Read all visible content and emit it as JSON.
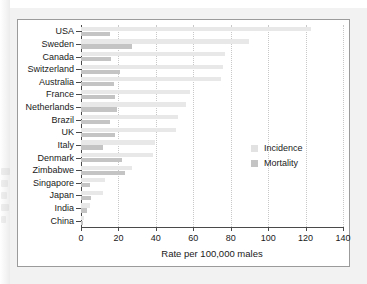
{
  "chart_data": {
    "type": "bar",
    "orientation": "horizontal",
    "title": "",
    "xlabel": "Rate per 100,000 males",
    "ylabel": "",
    "xlim": [
      0,
      140
    ],
    "xticks": [
      0,
      20,
      40,
      60,
      80,
      100,
      120,
      140
    ],
    "xtick_labels": [
      "0",
      "20",
      "40",
      "60",
      "80",
      "100",
      "120",
      "140"
    ],
    "grid": "vertical-dotted",
    "legend_position": "inside-right",
    "categories": [
      "USA",
      "Sweden",
      "Canada",
      "Switzerland",
      "Australia",
      "France",
      "Netherlands",
      "Brazil",
      "UK",
      "Italy",
      "Denmark",
      "Zimbabwe",
      "Singapore",
      "Japan",
      "India",
      "China"
    ],
    "series": [
      {
        "name": "Incidence",
        "color": "#e8e8e8",
        "values": [
          123,
          90,
          77,
          76,
          75,
          58,
          56,
          52,
          51,
          39.5,
          38.5,
          27,
          13,
          12,
          5,
          1.5
        ]
      },
      {
        "name": "Mortality",
        "color": "#c4c4c4",
        "values": [
          15.5,
          27,
          16,
          21,
          17.5,
          18,
          19,
          15.5,
          18,
          12,
          22,
          23.5,
          5,
          5.5,
          3,
          1
        ]
      }
    ]
  },
  "legend": {
    "items": [
      {
        "label": "Incidence",
        "color": "#e8e8e8"
      },
      {
        "label": "Mortality",
        "color": "#c4c4c4"
      }
    ]
  },
  "axis": {
    "x_title": "Rate per 100,000 males"
  }
}
